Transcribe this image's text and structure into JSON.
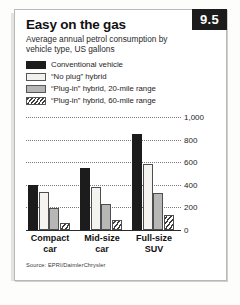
{
  "badge": {
    "label": "9.5"
  },
  "header": {
    "title": "Easy on the gas",
    "subtitle": "Average annual petrol consumption by vehicle type, US gallons"
  },
  "source": {
    "text": "Source: EPRI/DaimlerChrysler"
  },
  "colors": {
    "conventional": "#1c1c1c",
    "no_plug": "#f4f3f0",
    "plug_in_20": "#b7b7b5",
    "plug_in_60": "#ffffff",
    "gridline": "#7a7a7a",
    "axis": "#2b2b2b",
    "badge_bg": "#1c1c1c",
    "badge_text": "#ffffff"
  },
  "chart_data": {
    "type": "bar",
    "title": "Easy on the gas",
    "subtitle": "Average annual petrol consumption by vehicle type, US gallons",
    "xlabel": "",
    "ylabel": "US gallons",
    "categories": [
      "Compact car",
      "Mid-size car",
      "Full-size SUV"
    ],
    "category_lines": [
      [
        "Compact",
        "car"
      ],
      [
        "Mid-size",
        "car"
      ],
      [
        "Full-size",
        "SUV"
      ]
    ],
    "series": [
      {
        "name": "Conventional vehicle",
        "swatch": "black",
        "values": [
          400,
          545,
          850
        ]
      },
      {
        "name": "“No plug” hybrid",
        "swatch": "white",
        "values": [
          335,
          385,
          580
        ]
      },
      {
        "name": "“Plug-in” hybrid, 20-mile range",
        "swatch": "grey",
        "values": [
          195,
          230,
          330
        ]
      },
      {
        "name": "“Plug-in” hybrid, 60-mile range",
        "swatch": "hatch",
        "values": [
          65,
          90,
          135
        ]
      }
    ],
    "ylim": [
      0,
      1000
    ],
    "yticks": [
      0,
      200,
      400,
      600,
      800,
      1000
    ],
    "ytick_labels": [
      "0",
      "200",
      "400",
      "600",
      "800",
      "1,000"
    ],
    "grid": true,
    "legend_position": "above-plot",
    "source": "Source: EPRI/DaimlerChrysler"
  }
}
